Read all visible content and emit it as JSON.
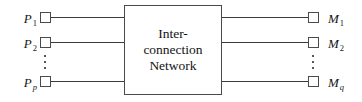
{
  "figure": {
    "background_color": "#ffffff",
    "line_color": "#3b3b3b",
    "box_border_color": "#4a4a4a",
    "text_color": "#121212"
  },
  "center_box": {
    "name": "Interconnection Network",
    "lines": [
      "Inter-",
      "connection",
      "Network"
    ]
  },
  "processors": {
    "group_label": "P",
    "items": [
      {
        "base": "P",
        "subscript": "1",
        "subscript_italic": false
      },
      {
        "base": "P",
        "subscript": "2",
        "subscript_italic": false
      },
      {
        "base": "P",
        "subscript": "p",
        "subscript_italic": true
      }
    ],
    "ellipsis": "⋮"
  },
  "memories": {
    "group_label": "M",
    "items": [
      {
        "base": "M",
        "subscript": "1",
        "subscript_italic": false
      },
      {
        "base": "M",
        "subscript": "2",
        "subscript_italic": false
      },
      {
        "base": "M",
        "subscript": "q",
        "subscript_italic": true
      }
    ],
    "ellipsis": "⋮"
  }
}
